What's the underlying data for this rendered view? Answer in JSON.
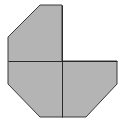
{
  "diagram": {
    "type": "partial-octagon-dissection",
    "width": 125,
    "height": 122,
    "colors": {
      "background": "#ffffff",
      "fill": "#b4b4b4",
      "stroke": "#3a3a3a",
      "divider": "#2a2a2a"
    },
    "shape": {
      "description": "Octagon with top-right quadrant removed (three quadrants shaded)",
      "points": [
        [
          40,
          5
        ],
        [
          62,
          5
        ],
        [
          62,
          61
        ],
        [
          117,
          61
        ],
        [
          117,
          84
        ],
        [
          86,
          117
        ],
        [
          40,
          117
        ],
        [
          8,
          84
        ],
        [
          8,
          37
        ]
      ]
    },
    "dividers": [
      {
        "name": "horizontal-divider",
        "x1": 8,
        "y1": 61,
        "x2": 117,
        "y2": 61
      },
      {
        "name": "vertical-divider",
        "x1": 62,
        "y1": 5,
        "x2": 62,
        "y2": 117
      }
    ]
  }
}
